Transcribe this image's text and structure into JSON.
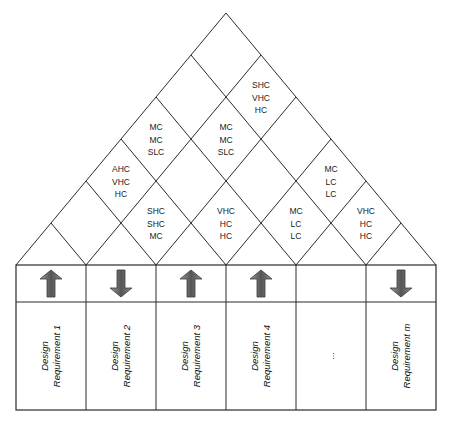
{
  "colors": {
    "line": "#2a2a2a",
    "arrow_dark": "#3a3a3a",
    "arrow_mid": "#6e6e6e",
    "arrow_light": "#9a9a9a",
    "background": "#ffffff"
  },
  "columns": [
    {
      "label_line1": "Design",
      "label_line2": "Requirement 1",
      "direction": "up"
    },
    {
      "label_line1": "Design",
      "label_line2": "Requirement 2",
      "direction": "down"
    },
    {
      "label_line1": "Design",
      "label_line2": "Requirement 3",
      "direction": "up"
    },
    {
      "label_line1": "Design",
      "label_line2": "Requirement 4",
      "direction": "up"
    },
    {
      "label_line1": "...",
      "label_line2": "",
      "direction": "none"
    },
    {
      "label_line1": "Design",
      "label_line2": "Requirement m",
      "direction": "down"
    }
  ],
  "correlations": [
    {
      "cols": [
        0,
        2
      ],
      "lines": [
        "AHC",
        "VHC",
        "HC"
      ]
    },
    {
      "cols": [
        0,
        3
      ],
      "lines": [
        "MC",
        "MC",
        "SLC"
      ]
    },
    {
      "cols": [
        1,
        2
      ],
      "lines": [
        "SHC",
        "SHC",
        "MC"
      ]
    },
    {
      "cols": [
        1,
        4
      ],
      "lines": [
        "MC",
        "MC",
        "SLC"
      ]
    },
    {
      "cols": [
        1,
        5
      ],
      "lines": [
        "SHC",
        "VHC",
        "HC"
      ]
    },
    {
      "cols": [
        2,
        3
      ],
      "lines": [
        "VHC",
        "HC",
        "HC"
      ]
    },
    {
      "cols": [
        3,
        4
      ],
      "lines": [
        "MC",
        "LC",
        "LC"
      ]
    },
    {
      "cols": [
        3,
        5
      ],
      "lines": [
        "MC",
        "LC",
        "LC"
      ]
    },
    {
      "cols": [
        4,
        5
      ],
      "lines": [
        "VHC",
        "HC",
        "HC"
      ]
    }
  ]
}
